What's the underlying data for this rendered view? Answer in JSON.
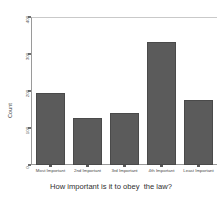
{
  "chart_data": {
    "type": "bar",
    "title": "",
    "xlabel": "How important is it to obey  the law?",
    "ylabel": "Count",
    "categories": [
      "Most Important",
      "2nd Important",
      "3rd Important",
      "4th Important",
      "Least Important"
    ],
    "values": [
      195,
      127,
      141,
      333,
      176
    ],
    "ylim": [
      0,
      400
    ],
    "yticks": [
      400,
      300,
      200,
      100,
      0
    ],
    "ytick_labels": [
      "400",
      "300",
      "200",
      "100",
      "0"
    ],
    "grid": false,
    "legend": null,
    "bar_color": "#5b5b5b",
    "axis_color": "#9a9a9a",
    "background": "#ffffff"
  }
}
